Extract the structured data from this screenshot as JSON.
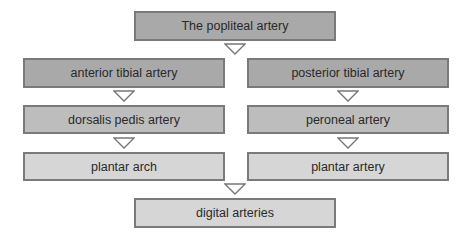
{
  "diagram": {
    "title_node": "The popliteal artery",
    "left_column": [
      "anterior tibial artery",
      "dorsalis pedis artery",
      "plantar arch"
    ],
    "right_column": [
      "posterior tibial artery",
      "peroneal artery",
      "plantar artery"
    ],
    "bottom_node": "digital arteries",
    "colors": {
      "level1": "#a9a9a9",
      "level2": "#bdbdbd",
      "level3": "#d6d6d6",
      "border": "#7a7a7a"
    }
  }
}
